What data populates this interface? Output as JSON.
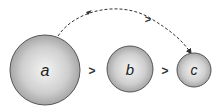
{
  "diagram": {
    "circles": [
      {
        "label": "a",
        "cx": 45,
        "cy": 70,
        "r": 35
      },
      {
        "label": "b",
        "cx": 130,
        "cy": 69,
        "r": 23
      },
      {
        "label": "c",
        "cx": 194,
        "cy": 70,
        "r": 17
      }
    ],
    "comparisons": [
      {
        "symbol": ">",
        "between": [
          "a",
          "b"
        ]
      },
      {
        "symbol": ">",
        "between": [
          "b",
          "c"
        ]
      }
    ],
    "arc": {
      "from": "a",
      "to": "c",
      "symbol": ">",
      "style": "dashed"
    },
    "colors": {
      "circle_edge": "#555555",
      "circle_fill_center": "#f4f4f4",
      "circle_fill_edge": "#9a9a9a",
      "arrow": "#333333"
    }
  }
}
